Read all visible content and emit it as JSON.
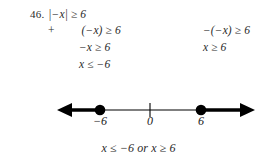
{
  "problem": {
    "number": "46.",
    "statement": "|−x| ≥ 6"
  },
  "steps": {
    "row2": {
      "operator": "+",
      "left": "(−x) ≥ 6",
      "right": "−(−x) ≥ 6"
    },
    "row3": {
      "left": "−x ≥ 6",
      "right": "x ≥ 6"
    },
    "row4": {
      "left": "x ≤ −6",
      "right": ""
    }
  },
  "number_line": {
    "labels": {
      "left_point": "−6",
      "origin": "0",
      "right_point": "6"
    },
    "points": [
      {
        "label": "−6",
        "value": -6,
        "closed": true,
        "ray": "left"
      },
      {
        "label": "6",
        "value": 6,
        "closed": true,
        "ray": "right"
      }
    ],
    "line_color": "#000000",
    "axis_start_x": 57,
    "axis_end_x": 255,
    "axis_y": 22,
    "tick_x": 150,
    "left_dot_x": 100,
    "right_dot_x": 201
  },
  "answer": {
    "text": "x ≤ −6 or x ≥ 6",
    "connector": "or"
  },
  "colors": {
    "background": "#ffffff",
    "text": "#2b2b2b",
    "ink": "#000000"
  }
}
